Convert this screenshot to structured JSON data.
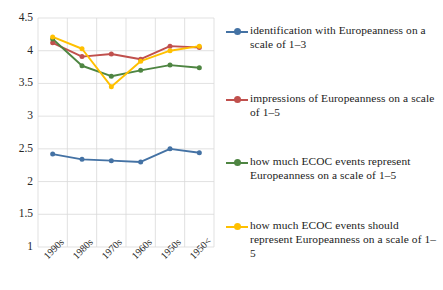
{
  "chart_data": {
    "type": "line",
    "title": "",
    "xlabel": "",
    "ylabel": "",
    "categories": [
      "1990s",
      "1980s",
      "1970s",
      "1960s",
      "1950s",
      "1950<"
    ],
    "ylim": [
      1,
      4.5
    ],
    "yticks": [
      "1",
      "1.5",
      "2",
      "2.5",
      "3",
      "3.5",
      "4",
      "4.5"
    ],
    "ytick_values": [
      1,
      1.5,
      2,
      2.5,
      3,
      3.5,
      4,
      4.5
    ],
    "grid": true,
    "legend_position": "right",
    "series": [
      {
        "name": "identification with Europeanness on a scale of 1–3",
        "color": "#4472A4",
        "values": [
          2.42,
          2.34,
          2.32,
          2.3,
          2.5,
          2.44
        ]
      },
      {
        "name": "impressions of Europeanness on a scale of 1–5",
        "color": "#C0504D",
        "values": [
          4.12,
          3.91,
          3.95,
          3.87,
          4.07,
          4.05
        ]
      },
      {
        "name": "how much ECOC events represent Europeanness on a scale of 1–5",
        "color": "#4E8542",
        "values": [
          4.18,
          3.77,
          3.61,
          3.7,
          3.78,
          3.74
        ]
      },
      {
        "name": "how much ECOC events should represent Europeanness on a scale of 1–5",
        "color": "#FFC000",
        "values": [
          4.21,
          4.03,
          3.45,
          3.84,
          4.0,
          4.07
        ]
      }
    ]
  },
  "legend": {
    "items": [
      {
        "label": "identification with Europeanness on a scale of 1–3",
        "color": "#4472A4"
      },
      {
        "label": "impressions of Europeanness on a scale of 1–5",
        "color": "#C0504D"
      },
      {
        "label": "how much ECOC events represent Europeanness on a scale of 1–5",
        "color": "#4E8542"
      },
      {
        "label": "how much ECOC events should represent Europeanness on a scale of 1–5",
        "color": "#FFC000"
      }
    ]
  }
}
